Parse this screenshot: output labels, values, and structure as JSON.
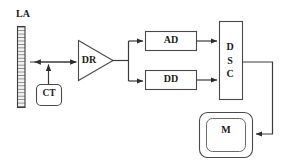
{
  "diagram": {
    "type": "block-diagram",
    "background_color": "#ffffff",
    "stroke_color": "#3a3a3a",
    "text_color": "#1a1a1a",
    "blocks": [
      {
        "id": "la",
        "label": "LA",
        "shape": "hatched-array-bar",
        "label_position": "above"
      },
      {
        "id": "ct",
        "label": "CT",
        "shape": "rounded-rect"
      },
      {
        "id": "dr",
        "label": "DR",
        "shape": "triangle-amplifier"
      },
      {
        "id": "ad",
        "label": "AD",
        "shape": "rect"
      },
      {
        "id": "dd",
        "label": "DD",
        "shape": "rect"
      },
      {
        "id": "dsc",
        "label": "D\nS\nC",
        "shape": "tall-rect"
      },
      {
        "id": "m",
        "label": "M",
        "shape": "double-rounded-rect"
      }
    ],
    "connections": [
      {
        "from": "dr",
        "to": "la",
        "arrow": "left"
      },
      {
        "from": "ct",
        "to": "la-dr-line",
        "arrow": "up"
      },
      {
        "from": "la",
        "to": "dr",
        "arrow": "right"
      },
      {
        "from": "dr",
        "to": "ad",
        "arrow": "right"
      },
      {
        "from": "dr",
        "to": "dd",
        "arrow": "right"
      },
      {
        "from": "ad",
        "to": "dsc",
        "arrow": "right"
      },
      {
        "from": "dd",
        "to": "dsc",
        "arrow": "right"
      },
      {
        "from": "dsc",
        "to": "m",
        "arrow": "left"
      }
    ]
  }
}
